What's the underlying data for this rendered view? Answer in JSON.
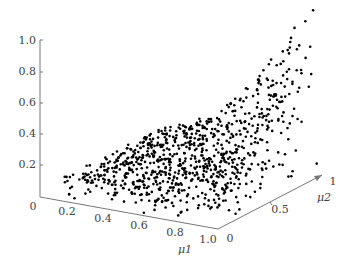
{
  "chart_data": {
    "type": "scatter",
    "subtype": "3d-scatter",
    "title": "",
    "axes": {
      "z": {
        "label": "",
        "ticks": [
          "0",
          "0.2",
          "0.4",
          "0.6",
          "0.8",
          "1.0"
        ],
        "range": [
          0,
          1.0
        ]
      },
      "x": {
        "label": "μ1",
        "ticks": [
          "0.2",
          "0.4",
          "0.6",
          "0.8",
          "1.0"
        ],
        "range": [
          0,
          1.0
        ]
      },
      "y": {
        "label": "μ2",
        "ticks": [
          "0",
          "0.5",
          "1"
        ],
        "range": [
          0,
          1
        ]
      }
    },
    "grid": false,
    "legend": null,
    "approx_points": 900,
    "marker_color": "#000000"
  }
}
